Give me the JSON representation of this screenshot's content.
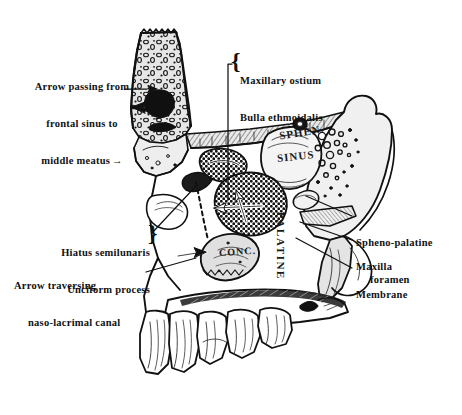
{
  "figure": {
    "background_color": "#ffffff",
    "ink_color": "#111111",
    "bone_fill": "#d8d8d8",
    "bone_fill_light": "#ececec",
    "cavity_fill": "#ffffff",
    "sinus_dark": "#141414"
  },
  "callouts": {
    "frontal_sinus_arrow": {
      "lines": [
        "Arrow passing from",
        "frontal sinus to",
        "middle meatus"
      ],
      "arrow_glyph": "→"
    },
    "maxillary_ostium": {
      "lines": [
        "Maxillary ostium",
        "Bulla ethmoidalis"
      ],
      "brace": "{"
    },
    "hiatus": {
      "lines": [
        "Hiatus semilunaris",
        "Unciform process"
      ],
      "brace": "}"
    },
    "naso_lacrimal": {
      "lines": [
        "Arrow traversing",
        "naso-lacrimal canal"
      ]
    },
    "spheno_palatine": {
      "lines": [
        "Spheno-palatine",
        "foramen"
      ]
    },
    "maxilla": {
      "lines": [
        "Maxilla"
      ]
    },
    "membrane": {
      "lines": [
        "Membrane"
      ]
    }
  },
  "figure_text": {
    "sphen": "SPHEN.",
    "sinus": "SINUS",
    "concha": "CONC.",
    "palatine": "PALATINE"
  }
}
